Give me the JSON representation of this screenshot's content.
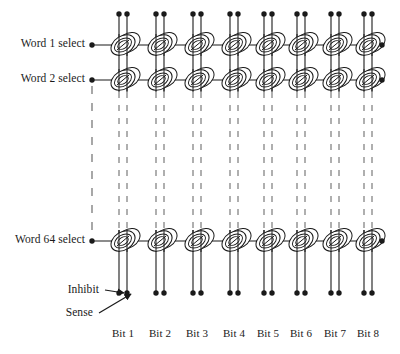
{
  "figure": {
    "type": "core-memory-array-diagram",
    "ink_color": "#1a1a1a",
    "dash_color": "#6e6e6e",
    "background": "#ffffff"
  },
  "row_labels": [
    {
      "text": "Word 1 select",
      "y": 45
    },
    {
      "text": "Word 2 select",
      "y": 80
    },
    {
      "text": "Word 64 select",
      "y": 241
    }
  ],
  "column_labels": [
    {
      "text": "Bit 1",
      "x": 123
    },
    {
      "text": "Bit 2",
      "x": 160
    },
    {
      "text": "Bit 3",
      "x": 197
    },
    {
      "text": "Bit 4",
      "x": 234
    },
    {
      "text": "Bit 5",
      "x": 268
    },
    {
      "text": "Bit 6",
      "x": 301
    },
    {
      "text": "Bit 7",
      "x": 335
    },
    {
      "text": "Bit 8",
      "x": 368
    }
  ],
  "annotations": [
    {
      "text": "Inhibit",
      "x": 99,
      "y": 292,
      "target_x": 124,
      "target_y": 293
    },
    {
      "text": "Sense",
      "x": 93,
      "y": 315,
      "target_x": 131,
      "target_y": 294
    }
  ],
  "geometry": {
    "word_rows_y": [
      45,
      80,
      241
    ],
    "bit_columns_x": [
      123,
      160,
      197,
      234,
      268,
      301,
      335,
      368
    ],
    "wire_pair_offset": 4,
    "word_line_left_x": 92,
    "word_line_right_x": 382,
    "top_terminal_y": 14,
    "bottom_terminal_y": 293,
    "dash_top_y": 92,
    "dash_bottom_y": 230,
    "core_rx": 13,
    "core_ry": 9
  },
  "counts": {
    "words_shown": 3,
    "bits": 8,
    "cores_drawn": 24
  }
}
